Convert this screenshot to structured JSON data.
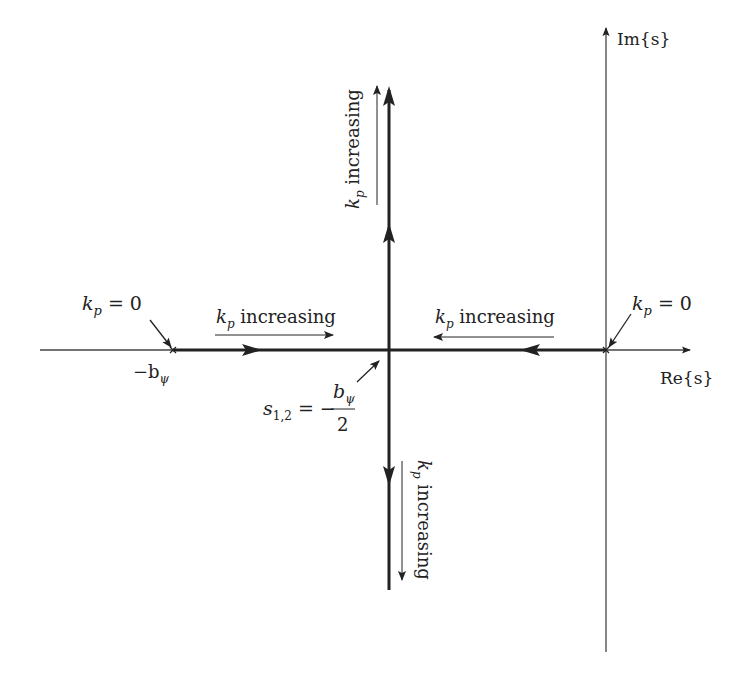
{
  "diagram": {
    "type": "root-locus",
    "axes": {
      "real_label": "Re{s}",
      "imag_label": "Im{s}"
    },
    "poles": [
      {
        "name": "pole-neg-b",
        "label": "−b",
        "subscript": "ψ",
        "gain_label": "k",
        "gain_sub": "p",
        "gain_value": " = 0"
      },
      {
        "name": "pole-origin",
        "label": "",
        "gain_label": "k",
        "gain_sub": "p",
        "gain_value": " = 0"
      }
    ],
    "breakaway": {
      "lhs": "s",
      "lhs_sub": "1,2",
      "eq": " = −",
      "numerator": "b",
      "numerator_sub": "ψ",
      "denominator": "2"
    },
    "direction_labels": [
      {
        "id": "left-branch",
        "k": "k",
        "sub": "p",
        "text": " increasing"
      },
      {
        "id": "right-branch",
        "k": "k",
        "sub": "p",
        "text": " increasing"
      },
      {
        "id": "upper-branch",
        "k": "k",
        "sub": "p",
        "text": " increasing"
      },
      {
        "id": "lower-branch",
        "k": "k",
        "sub": "p",
        "text": " increasing"
      }
    ],
    "colors": {
      "line": "#222222",
      "axis": "#444444",
      "background": "#ffffff"
    }
  }
}
